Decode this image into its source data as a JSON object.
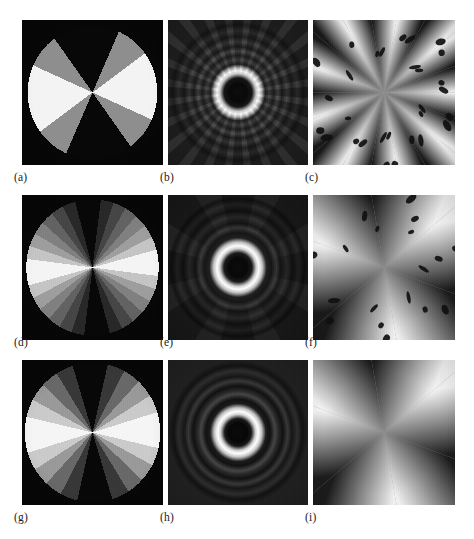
{
  "figure": {
    "background_color": "#ffffff",
    "columns": 3,
    "rows": 3,
    "panel_labels": [
      "(a)",
      "(b)",
      "(c)",
      "(d)",
      "(e)",
      "(f)",
      "(g)",
      "(h)",
      "(i)"
    ]
  },
  "panels": [
    {
      "id": "a",
      "label": "(a)",
      "kind": "radial-wedge-object",
      "quantization_levels": 3,
      "sector_count": 24,
      "gray_values": [
        "#0c0c0c",
        "#8f8f8f",
        "#f2f2f2"
      ],
      "background_color": "#0b0b0b",
      "disk_fraction": 0.92
    },
    {
      "id": "b",
      "label": "(b)",
      "kind": "fourier-magnitude",
      "ring_count": 5,
      "angular_lobes": 24,
      "center_color": "#101010",
      "ring_color": "#fbfbfb",
      "background_color": "#1c1c1c"
    },
    {
      "id": "c",
      "label": "(c)",
      "kind": "phase-map",
      "sector_count": 18,
      "blob_count": 30,
      "light_color": "#f4f4f4",
      "dark_color": "#1e1e1e"
    },
    {
      "id": "d",
      "label": "(d)",
      "kind": "radial-wedge-object",
      "quantization_levels": 8,
      "sector_count": 32,
      "gray_values": [
        "#0c0c0c",
        "#2b2b2b",
        "#484848",
        "#646464",
        "#818181",
        "#9e9e9e",
        "#c4c4c4",
        "#f3f3f3"
      ],
      "background_color": "#0b0b0b",
      "disk_fraction": 0.94
    },
    {
      "id": "e",
      "label": "(e)",
      "kind": "fourier-magnitude",
      "ring_count": 4,
      "angular_lobes": 8,
      "center_color": "#0e0e0e",
      "ring_color": "#fbfbfb",
      "background_color": "#161616"
    },
    {
      "id": "f",
      "label": "(f)",
      "kind": "phase-map",
      "sector_count": 6,
      "blob_count": 18,
      "light_color": "#f4f4f4",
      "dark_color": "#1e1e1e"
    },
    {
      "id": "g",
      "label": "(g)",
      "kind": "radial-wedge-object",
      "quantization_levels": 32,
      "sector_count": 48,
      "gray_values": [
        "#0c0c0c",
        "#3a3a3a",
        "#6a6a6a",
        "#9a9a9a",
        "#cacaca",
        "#f4f4f4"
      ],
      "background_color": "#0b0b0b",
      "disk_fraction": 0.96
    },
    {
      "id": "h",
      "label": "(h)",
      "kind": "fourier-magnitude",
      "ring_count": 4,
      "angular_lobes": 0,
      "center_color": "#0d0d0d",
      "ring_color": "#fcfcfc",
      "background_color": "#131313"
    },
    {
      "id": "i",
      "label": "(i)",
      "kind": "phase-map",
      "sector_count": 6,
      "blob_count": 0,
      "light_color": "#f6f6f6",
      "dark_color": "#202020"
    }
  ]
}
